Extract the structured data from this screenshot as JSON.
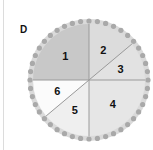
{
  "panel": {
    "label": "D"
  },
  "diagram": {
    "center": [
      89,
      80
    ],
    "radius": 56,
    "dot_ring_radius": 59,
    "dot_count": 44,
    "dot_color": "#a9a9a9",
    "rim_color": "#dadada",
    "divider_color": "#9a9a9a",
    "sectors": [
      {
        "label": "1",
        "start_deg": 180,
        "end_deg": 270,
        "color": "#c8c8c8"
      },
      {
        "label": "2",
        "start_deg": 270,
        "end_deg": 320,
        "color": "#dcdcdc"
      },
      {
        "label": "3",
        "start_deg": 320,
        "end_deg": 360,
        "color": "#e2e2e2"
      },
      {
        "label": "4",
        "start_deg": 0,
        "end_deg": 90,
        "color": "#e6e6e6"
      },
      {
        "label": "5",
        "start_deg": 90,
        "end_deg": 140,
        "color": "#efefef"
      },
      {
        "label": "6",
        "start_deg": 140,
        "end_deg": 180,
        "color": "#fbfbfb"
      }
    ]
  }
}
